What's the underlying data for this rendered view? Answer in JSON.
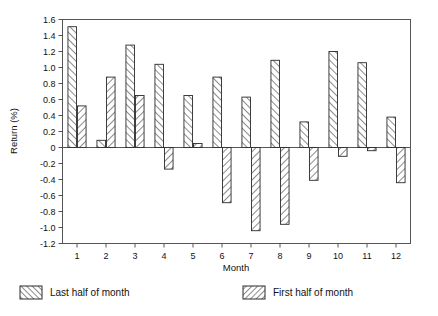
{
  "chart_data": {
    "type": "bar",
    "title": "",
    "subtitle": "",
    "xlabel": "Month",
    "ylabel": "Return (%)",
    "categories": [
      "1",
      "2",
      "3",
      "4",
      "5",
      "6",
      "7",
      "8",
      "9",
      "10",
      "11",
      "12"
    ],
    "xtick_labels": [
      "1",
      "2",
      "3",
      "4",
      "5",
      "6",
      "7",
      "8",
      "9",
      "10",
      "11",
      "12"
    ],
    "ytick_labels": [
      "1.6",
      "1.4",
      "1.2",
      "1.0",
      "0.8",
      "0.6",
      "0.4",
      "0.2",
      "0",
      "-0.2",
      "-0.4",
      "-0.6",
      "-0.8",
      "-1.0",
      "-1.2"
    ],
    "ytick_values": [
      1.6,
      1.4,
      1.2,
      1.0,
      0.8,
      0.6,
      0.4,
      0.2,
      0,
      -0.2,
      -0.4,
      -0.6,
      -0.8,
      -1.0,
      -1.2
    ],
    "ylim": [
      -1.2,
      1.6
    ],
    "grid": false,
    "legend_position": "below",
    "series": [
      {
        "name": "Last half of month",
        "hatch": "forward-slash",
        "values": [
          1.51,
          0.09,
          1.28,
          1.04,
          0.65,
          0.88,
          0.63,
          1.09,
          0.32,
          1.2,
          1.06,
          0.38
        ]
      },
      {
        "name": "First half of month",
        "hatch": "back-slash",
        "values": [
          0.52,
          0.88,
          0.65,
          -0.27,
          0.05,
          -0.69,
          -1.04,
          -0.96,
          -0.41,
          -0.11,
          -0.04,
          -0.44
        ]
      }
    ]
  },
  "legend": {
    "items": [
      {
        "label": "Last half of month",
        "swatch": "hatch-forward-slash-swatch"
      },
      {
        "label": "First half of month",
        "swatch": "hatch-back-slash-swatch"
      }
    ]
  },
  "colors": {
    "axis": "#555555",
    "bar_outline": "#2b2b2b",
    "hatch": "#2b2b2b",
    "background": "#ffffff",
    "text": "#111111"
  }
}
